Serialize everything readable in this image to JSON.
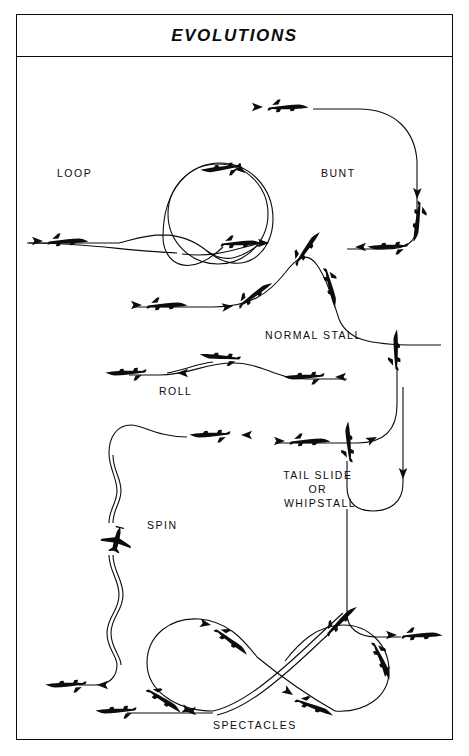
{
  "header": {
    "title": "EVOLUTIONS"
  },
  "diagram": {
    "type": "technical-illustration",
    "background_color": "#ffffff",
    "ink_color": "#0c0c0c",
    "maneuvers": [
      {
        "id": "loop",
        "label": "LOOP",
        "label_x": 62,
        "label_y": 118,
        "description": "inside loop: level entry from left, vertical climb into full circle, inverted at apex, exit level to the right",
        "aircraft_count": 3
      },
      {
        "id": "bunt",
        "label": "BUNT",
        "label_x": 320,
        "label_y": 118,
        "description": "outside loop: level entry at top, pushover descending right side nose-down, inverted exit at lower left",
        "aircraft_count": 3
      },
      {
        "id": "normal-stall",
        "label": "NORMAL STALL",
        "label_x": 256,
        "label_y": 282,
        "description": "level flight, pitch up to apex, stall break, nose-down recovery descent",
        "aircraft_count": 4
      },
      {
        "id": "roll",
        "label": "ROLL",
        "label_x": 160,
        "label_y": 336,
        "description": "right-to-left axial roll: level, inverted mid-roll, level again",
        "aircraft_count": 3
      },
      {
        "id": "spin",
        "label": "SPIN",
        "label_x": 147,
        "label_y": 472,
        "description": "stall then helical autorotative descent, plan-view aircraft mid-spin, level recovery at bottom",
        "aircraft_count": 3
      },
      {
        "id": "tail-slide",
        "label_lines": [
          "TAIL SLIDE",
          "OR",
          "WHIPSTALL"
        ],
        "label_x": 303,
        "label_y": 432,
        "description": "vertical climb to zero airspeed, aircraft slides backward on its tail, whips nose-down, recovers level",
        "aircraft_count": 5
      },
      {
        "id": "spectacles",
        "label": "SPECTACLES",
        "label_x": 243,
        "label_y": 665,
        "description": "figure-eight: two tangent loops joined by a crossing diagonal",
        "aircraft_count": 6
      }
    ]
  }
}
